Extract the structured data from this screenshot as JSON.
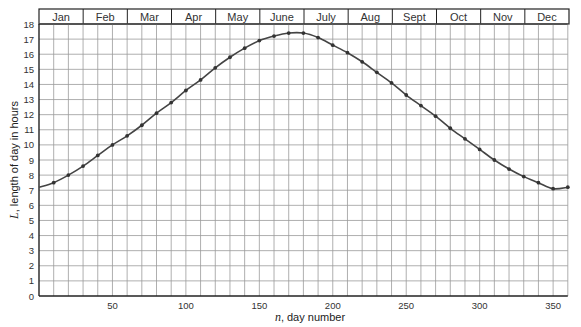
{
  "chart_data": {
    "type": "line",
    "title": "",
    "xlabel": "n, day number",
    "xlabel_var": "n",
    "xlabel_rest": ", day number",
    "ylabel": "L, length of day in hours",
    "ylabel_var": "L",
    "ylabel_rest": ", length of day in hours",
    "xlim": [
      0,
      360
    ],
    "ylim": [
      0,
      18
    ],
    "x_ticks": [
      50,
      100,
      150,
      200,
      250,
      300,
      350
    ],
    "y_ticks": [
      0,
      1,
      2,
      3,
      4,
      5,
      6,
      7,
      8,
      9,
      10,
      11,
      12,
      13,
      14,
      15,
      16,
      17,
      18
    ],
    "grid": true,
    "grid_x_step": 10,
    "grid_y_step": 1,
    "months": [
      "Jan",
      "Feb",
      "Mar",
      "Apr",
      "May",
      "June",
      "July",
      "Aug",
      "Sept",
      "Oct",
      "Nov",
      "Dec"
    ],
    "series": [
      {
        "name": "Length of day",
        "x": [
          0,
          10,
          20,
          30,
          40,
          50,
          60,
          70,
          80,
          90,
          100,
          110,
          120,
          130,
          140,
          150,
          160,
          170,
          180,
          190,
          200,
          210,
          220,
          230,
          240,
          250,
          260,
          270,
          280,
          290,
          300,
          310,
          320,
          330,
          340,
          350,
          360
        ],
        "values": [
          7.2,
          7.5,
          8.0,
          8.6,
          9.3,
          10.0,
          10.6,
          11.3,
          12.1,
          12.8,
          13.6,
          14.3,
          15.1,
          15.8,
          16.4,
          16.9,
          17.2,
          17.4,
          17.4,
          17.1,
          16.6,
          16.1,
          15.5,
          14.8,
          14.1,
          13.3,
          12.6,
          11.9,
          11.1,
          10.4,
          9.7,
          9.0,
          8.4,
          7.9,
          7.5,
          7.1,
          7.2
        ]
      }
    ],
    "colors": {
      "line": "#444444",
      "marker": "#333333",
      "grid": "#9a9a9a",
      "axis": "#222222"
    }
  }
}
